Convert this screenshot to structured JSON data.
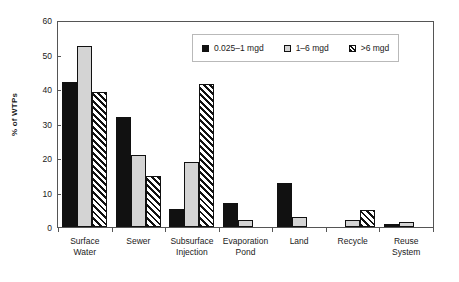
{
  "chart_data": {
    "type": "bar",
    "title": "",
    "xlabel": "",
    "ylabel": "% of WTPs",
    "ylim": [
      0,
      60
    ],
    "yticks": [
      0,
      10,
      20,
      30,
      40,
      50,
      60
    ],
    "grid": false,
    "legend_position": "top-right-inside",
    "categories": [
      "Surface Water",
      "Sewer",
      "Subsurface Injection",
      "Evaporation Pond",
      "Land",
      "Recycle",
      "Reuse System"
    ],
    "category_lines": [
      [
        "Surface",
        "Water"
      ],
      [
        "Sewer",
        ""
      ],
      [
        "Subsurface",
        "Injection"
      ],
      [
        "Evaporation",
        "Pond"
      ],
      [
        "Land",
        ""
      ],
      [
        "Recycle",
        ""
      ],
      [
        "Reuse",
        "System"
      ]
    ],
    "series": [
      {
        "name": "0.025–1 mgd",
        "pattern": "solid-black",
        "color": "#111111",
        "values": [
          42.5,
          32.2,
          5.2,
          7.0,
          12.8,
          0,
          1.0
        ]
      },
      {
        "name": "1–6 mgd",
        "pattern": "solid-light-gray",
        "color": "#d4d4d4",
        "values": [
          53.0,
          21.0,
          19.0,
          2.0,
          3.0,
          2.0,
          1.5
        ]
      },
      {
        "name": ">6 mgd",
        "pattern": "diagonal-hatch",
        "color": "#ffffff",
        "values": [
          39.5,
          14.8,
          42.0,
          0,
          0,
          5.0,
          0
        ]
      }
    ]
  },
  "legend": {
    "items": [
      {
        "label": "0.025–1 mgd"
      },
      {
        "label": "1–6 mgd"
      },
      {
        "label": ">6 mgd"
      }
    ]
  },
  "axes": {
    "y_title": "% of WTPs",
    "y_tick_labels": [
      "0",
      "10",
      "20",
      "30",
      "40",
      "50",
      "60"
    ]
  }
}
